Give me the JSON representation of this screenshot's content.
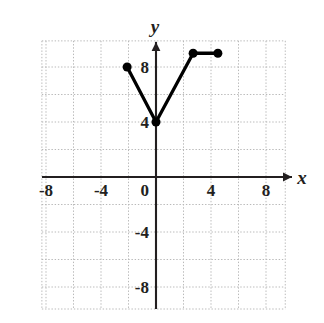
{
  "chart_data": {
    "type": "line",
    "title": "",
    "xlabel": "x",
    "ylabel": "y",
    "xlim": [
      -10,
      10
    ],
    "ylim": [
      -10,
      10
    ],
    "grid": true,
    "grid_step": 2,
    "legend": "none",
    "x_ticks": [
      -8,
      -4,
      4,
      8
    ],
    "y_ticks": [
      8,
      4,
      -4,
      -8
    ],
    "origin_label": "0",
    "x_tick_labels": [
      "-8",
      "-4",
      "4",
      "8"
    ],
    "y_tick_labels": [
      "8",
      "4",
      "-4",
      "-8"
    ],
    "series": [
      {
        "name": "piecewise-graph",
        "points": [
          {
            "x": -2.1,
            "y": 8.0,
            "marker": "filled-dot"
          },
          {
            "x": 0.0,
            "y": 4.0,
            "marker": "filled-dot"
          },
          {
            "x": 2.7,
            "y": 9.0,
            "marker": "filled-dot"
          },
          {
            "x": 4.5,
            "y": 9.0,
            "marker": "filled-dot"
          }
        ],
        "line_color": "#000000",
        "line_width": 3,
        "marker_color": "#000000",
        "marker_radius": 4.5
      }
    ]
  },
  "styling": {
    "background_color": "#ffffff",
    "grid_color": "#b9b9b9",
    "axis_color": "#231f20",
    "curve_color": "#000000"
  },
  "labels": {
    "y_axis_name": "y",
    "x_axis_name": "x"
  }
}
